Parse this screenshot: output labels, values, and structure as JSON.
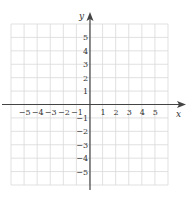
{
  "diagram": {
    "type": "coordinate-plane",
    "x_axis_label": "x",
    "y_axis_label": "y",
    "x_range": [
      -6,
      6
    ],
    "y_range": [
      -6,
      6
    ],
    "x_tick_labels": [
      "-5",
      "-4",
      "-3",
      "-2",
      "-1",
      "1",
      "2",
      "3",
      "4",
      "5"
    ],
    "y_tick_labels": [
      "5",
      "4",
      "3",
      "2",
      "1",
      "-1",
      "-2",
      "-3",
      "-4",
      "-5"
    ],
    "grid": true,
    "colors": {
      "grid": "#d9d9d9",
      "axis": "#444444",
      "text": "#333333",
      "background": "#ffffff"
    }
  }
}
